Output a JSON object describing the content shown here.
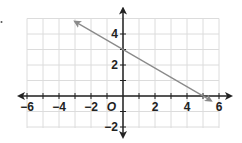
{
  "chart_data": {
    "type": "line",
    "title": "",
    "xlabel": "",
    "ylabel": "",
    "xlim": [
      -6,
      6
    ],
    "ylim": [
      -2,
      5
    ],
    "grid": true,
    "origin_label": "O",
    "x_tick_labels": [
      "−6",
      "−4",
      "−2",
      "2",
      "4",
      "6"
    ],
    "x_tick_values": [
      -6,
      -4,
      -2,
      2,
      4,
      6
    ],
    "y_tick_labels": [
      "4",
      "2",
      "−2"
    ],
    "y_tick_values": [
      4,
      2,
      -2
    ],
    "series": [
      {
        "name": "line",
        "equation": "y = -3/5 x + 3",
        "x": [
          -3,
          5.5
        ],
        "y": [
          4.8,
          -0.3
        ],
        "passes_through": [
          [
            0,
            3
          ],
          [
            5,
            0
          ]
        ],
        "arrows": "both",
        "color": "#8a8a8a"
      }
    ]
  },
  "colors": {
    "grid": "#dcdcdc",
    "axis": "#222222",
    "line": "#8a8a8a"
  }
}
